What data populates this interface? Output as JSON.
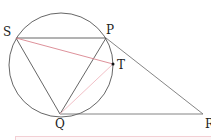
{
  "diagram": {
    "type": "geometry",
    "circle": {
      "cx": 61,
      "cy": 65,
      "r": 52,
      "color": "#555555"
    },
    "points": {
      "S": {
        "x": 16,
        "y": 38,
        "label": "S",
        "lx": 3,
        "ly": 36
      },
      "P": {
        "x": 106,
        "y": 38,
        "label": "P",
        "lx": 106,
        "ly": 34
      },
      "T": {
        "x": 113,
        "y": 64,
        "label": "T",
        "lx": 117,
        "ly": 69
      },
      "Q": {
        "x": 60,
        "y": 114,
        "label": "Q",
        "lx": 55,
        "ly": 128
      },
      "R": {
        "x": 203,
        "y": 114,
        "label": "R",
        "lx": 205,
        "ly": 128
      }
    },
    "segments": [
      {
        "from": "S",
        "to": "P",
        "color": "#555555"
      },
      {
        "from": "S",
        "to": "Q",
        "color": "#555555"
      },
      {
        "from": "P",
        "to": "Q",
        "color": "#555555"
      },
      {
        "from": "Q",
        "to": "R",
        "color": "#777777"
      },
      {
        "from": "P",
        "to": "R",
        "color": "#777777"
      },
      {
        "from": "S",
        "to": "T",
        "color": "#d9848f"
      },
      {
        "from": "Q",
        "to": "T",
        "color": "#efb8bf"
      }
    ],
    "labels": {
      "S": "S",
      "P": "P",
      "T": "T",
      "Q": "Q",
      "R": "R"
    }
  }
}
